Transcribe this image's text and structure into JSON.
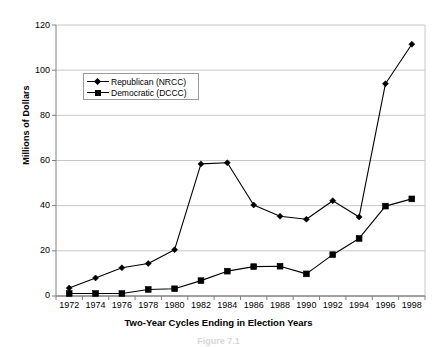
{
  "chart_data": {
    "type": "line",
    "title": "",
    "xlabel": "Two-Year Cycles Ending in Election Years",
    "ylabel": "Millions of Dollars",
    "ylim": [
      0,
      120
    ],
    "ytick_step": 20,
    "yticks": [
      "120",
      "100",
      "80",
      "60",
      "40",
      "20",
      "0"
    ],
    "grid": true,
    "legend_position": "upper-left-inside",
    "x_tick_labels": [
      "1972",
      "1974",
      "1976",
      "1978",
      "1980",
      "1982",
      "1984",
      "1986",
      "1988",
      "1990",
      "1992",
      "1994",
      "1996",
      "1998"
    ],
    "categories": [
      1972,
      1974,
      1976,
      1978,
      1980,
      1982,
      1984,
      1986,
      1988,
      1990,
      1992,
      1994,
      1996,
      1998
    ],
    "series": [
      {
        "name": "Republican (NRCC)",
        "marker": "diamond",
        "color": "#000000",
        "values": [
          3.5,
          8.0,
          12.5,
          14.4,
          20.5,
          58.5,
          59.0,
          40.3,
          35.3,
          34.0,
          42.2,
          35.0,
          94.0,
          111.5
        ]
      },
      {
        "name": "Democratic (DCCC)",
        "marker": "square",
        "color": "#000000",
        "values": [
          1.1,
          1.1,
          1.1,
          2.9,
          3.2,
          6.8,
          11.0,
          13.0,
          13.2,
          9.8,
          18.3,
          25.5,
          39.8,
          43.0
        ]
      }
    ]
  },
  "legend": {
    "items": [
      {
        "label": "Republican (NRCC)",
        "marker": "diamond"
      },
      {
        "label": "Democratic (DCCC)",
        "marker": "square"
      }
    ]
  },
  "caption": {
    "text": "Figure 7.1"
  }
}
